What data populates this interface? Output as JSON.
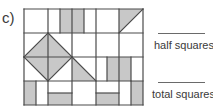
{
  "part_label": "c)",
  "colors": {
    "stroke": "#4a4a4a",
    "fill": "#c8c8c8",
    "background": "#ffffff"
  },
  "grid": {
    "origin": [
      24,
      9
    ],
    "cols": 5,
    "rows": 4,
    "cell_w": 23.8,
    "cell_h": 24,
    "shaded_rects": [
      {
        "x": 60,
        "y": 9,
        "w": 12,
        "h": 24
      },
      {
        "x": 72,
        "y": 9,
        "w": 12,
        "h": 24
      },
      {
        "x": 107,
        "y": 57,
        "w": 12,
        "h": 24
      },
      {
        "x": 119,
        "y": 57,
        "w": 12,
        "h": 24
      },
      {
        "x": 24,
        "y": 81,
        "w": 12,
        "h": 24
      },
      {
        "x": 48,
        "y": 93,
        "w": 24,
        "h": 12
      },
      {
        "x": 96,
        "y": 93,
        "w": 23,
        "h": 12
      },
      {
        "x": 131,
        "y": 81,
        "w": 12,
        "h": 24
      }
    ],
    "shaded_polygons": [
      {
        "points": "48,33 72,57 48,81 24,57"
      },
      {
        "points": "72,57 96,81 72,81"
      },
      {
        "points": "119,9 143,9 119,33"
      }
    ],
    "lines": [
      {
        "x1": 24,
        "y1": 9,
        "x2": 143,
        "y2": 9
      },
      {
        "x1": 24,
        "y1": 33,
        "x2": 143,
        "y2": 33
      },
      {
        "x1": 24,
        "y1": 57,
        "x2": 143,
        "y2": 57
      },
      {
        "x1": 24,
        "y1": 81,
        "x2": 143,
        "y2": 81
      },
      {
        "x1": 24,
        "y1": 105,
        "x2": 143,
        "y2": 105
      },
      {
        "x1": 24,
        "y1": 9,
        "x2": 24,
        "y2": 105
      },
      {
        "x1": 48,
        "y1": 9,
        "x2": 48,
        "y2": 105
      },
      {
        "x1": 72,
        "y1": 9,
        "x2": 72,
        "y2": 105
      },
      {
        "x1": 96,
        "y1": 9,
        "x2": 96,
        "y2": 105
      },
      {
        "x1": 119,
        "y1": 9,
        "x2": 119,
        "y2": 105
      },
      {
        "x1": 143,
        "y1": 9,
        "x2": 143,
        "y2": 105
      },
      {
        "x1": 60,
        "y1": 9,
        "x2": 60,
        "y2": 33
      },
      {
        "x1": 84,
        "y1": 9,
        "x2": 84,
        "y2": 33
      },
      {
        "x1": 107,
        "y1": 57,
        "x2": 107,
        "y2": 81
      },
      {
        "x1": 131,
        "y1": 57,
        "x2": 131,
        "y2": 81
      },
      {
        "x1": 36,
        "y1": 81,
        "x2": 36,
        "y2": 105
      },
      {
        "x1": 131,
        "y1": 81,
        "x2": 131,
        "y2": 105
      },
      {
        "x1": 48,
        "y1": 93,
        "x2": 72,
        "y2": 93
      },
      {
        "x1": 96,
        "y1": 93,
        "x2": 119,
        "y2": 93
      },
      {
        "x1": 48,
        "y1": 33,
        "x2": 72,
        "y2": 57
      },
      {
        "x1": 72,
        "y1": 57,
        "x2": 48,
        "y2": 81
      },
      {
        "x1": 48,
        "y1": 81,
        "x2": 24,
        "y2": 57
      },
      {
        "x1": 24,
        "y1": 57,
        "x2": 48,
        "y2": 33
      },
      {
        "x1": 72,
        "y1": 57,
        "x2": 96,
        "y2": 81
      },
      {
        "x1": 119,
        "y1": 33,
        "x2": 143,
        "y2": 9
      }
    ]
  },
  "answers": [
    {
      "label": "half squares",
      "line": {
        "x": 158,
        "y": 33,
        "w": 47
      },
      "label_pos": {
        "x": 154,
        "y": 39
      }
    },
    {
      "label": "total squares",
      "line": {
        "x": 158,
        "y": 82,
        "w": 47
      },
      "label_pos": {
        "x": 152,
        "y": 88
      }
    }
  ]
}
